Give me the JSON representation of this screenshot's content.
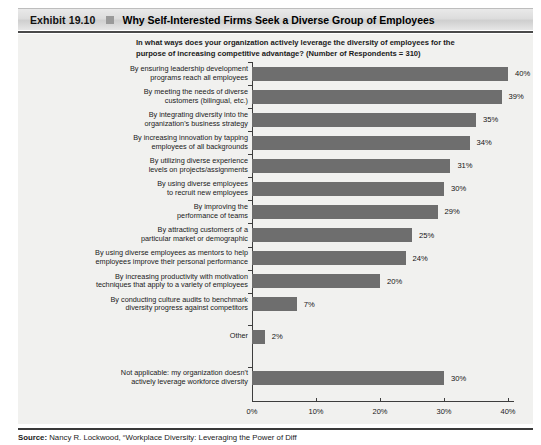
{
  "exhibit": {
    "label": "Exhibit 19.10",
    "title": "Why Self-Interested Firms Seek a Diverse Group of Employees"
  },
  "question": "In what ways does your organization actively leverage the diversity of employees for the purpose of increasing competitive advantage? (Number of Respondents = 310)",
  "source": {
    "prefix": "Source:",
    "text": "Nancy R. Lockwood, “Workplace Diversity: Leveraging the Power of Diff"
  },
  "colors": {
    "bar": "#6e6e6e",
    "panel_background": "#f1f1ef",
    "axis": "#3d3d3d",
    "header_bar": "#dddddd"
  },
  "chart_data": {
    "type": "bar",
    "orientation": "horizontal",
    "title": "Why Self-Interested Firms Seek a Diverse Group of Employees",
    "subtitle": "In what ways does your organization actively leverage the diversity of employees for the purpose of increasing competitive advantage? (Number of Respondents = 310)",
    "xlabel": "",
    "ylabel": "",
    "xlim": [
      0,
      40
    ],
    "xticks": [
      0,
      10,
      20,
      30,
      40
    ],
    "xtick_labels": [
      "0%",
      "10%",
      "20%",
      "30%",
      "40%"
    ],
    "grid": false,
    "legend": false,
    "value_suffix": "%",
    "categories": [
      "By ensuring leadership development programs reach all employees",
      "By meeting the needs of diverse customers (bilingual, etc.)",
      "By integrating diversity into the organization's business strategy",
      "By increasing innovation by tapping employees of all backgrounds",
      "By utilizing diverse experience levels on projects/assignments",
      "By using diverse employees to recruit new employees",
      "By improving the performance of teams",
      "By attracting customers of a particular market or demographic",
      "By using diverse employees as mentors to help employees improve their personal performance",
      "By increasing productivity with motivation techniques that apply to a variety of employees",
      "By conducting culture audits to benchmark diversity progress against competitors",
      "Other",
      "Not applicable: my organization doesn't actively leverage workforce diversity"
    ],
    "category_lines": [
      [
        "By ensuring leadership development",
        "programs reach all employees"
      ],
      [
        "By meeting the needs of diverse",
        "customers (bilingual, etc.)"
      ],
      [
        "By integrating diversity into the",
        "organization's business strategy"
      ],
      [
        "By increasing innovation by tapping",
        "employees of all backgrounds"
      ],
      [
        "By utilizing diverse experience",
        "levels on projects/assignments"
      ],
      [
        "By using diverse employees",
        "to recruit new employees"
      ],
      [
        "By improving the",
        "performance of teams"
      ],
      [
        "By attracting customers of a",
        "particular market or demographic"
      ],
      [
        "By using diverse employees as mentors to help",
        "employees improve their personal performance"
      ],
      [
        "By increasing productivity with motivation",
        "techniques that apply to a variety of employees"
      ],
      [
        "By conducting culture audits to benchmark",
        "diversity progress against competitors"
      ],
      [
        "Other"
      ],
      [
        "Not applicable: my organization doesn't",
        "actively leverage workforce diversity"
      ]
    ],
    "values": [
      40,
      39,
      35,
      34,
      31,
      30,
      29,
      25,
      24,
      20,
      7,
      2,
      30
    ],
    "value_labels": [
      "40%",
      "39%",
      "35%",
      "34%",
      "31%",
      "30%",
      "29%",
      "25%",
      "24%",
      "20%",
      "7%",
      "2%",
      "30%"
    ],
    "row_slots": [
      0,
      1,
      2,
      3,
      4,
      5,
      6,
      7,
      8,
      9,
      10,
      11.4,
      13.2
    ]
  }
}
